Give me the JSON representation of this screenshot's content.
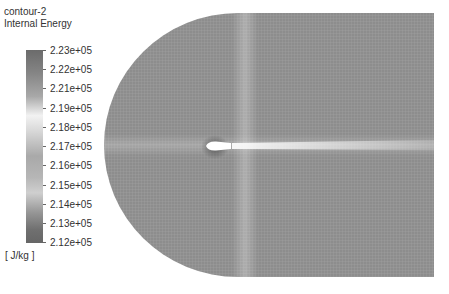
{
  "legend": {
    "title": "contour-2",
    "variable": "Internal Energy",
    "units": "[ J/kg ]",
    "ticks": [
      "2.23e+05",
      "2.22e+05",
      "2.21e+05",
      "2.19e+05",
      "2.18e+05",
      "2.17e+05",
      "2.16e+05",
      "2.15e+05",
      "2.14e+05",
      "2.13e+05",
      "2.12e+05"
    ],
    "colormap": "greyscale"
  },
  "plot": {
    "description": "C-grid mesh contour of internal energy around airfoil with wake",
    "background": "#ffffff",
    "field_base_color": "#8e8e8e"
  }
}
